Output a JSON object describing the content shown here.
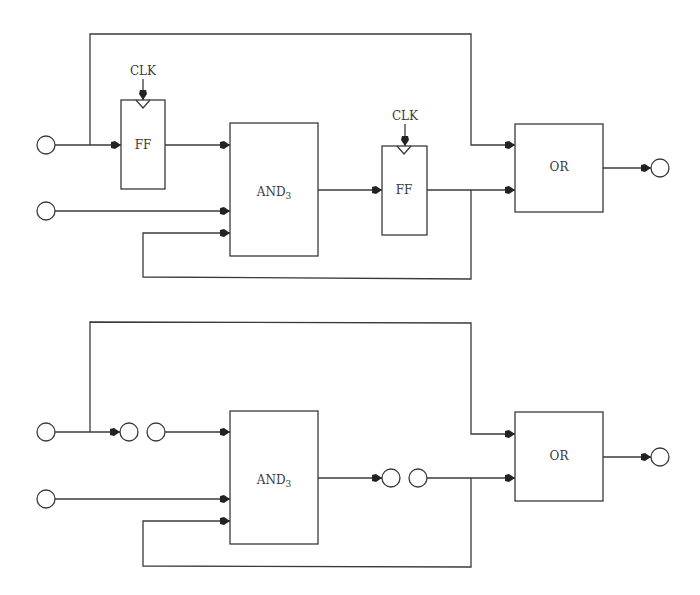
{
  "diagram": {
    "top": {
      "clk_label_1": "CLK",
      "clk_label_2": "CLK",
      "ff1_label": "FF",
      "ff2_label": "FF",
      "and_label": "AND",
      "and_subscript": "3",
      "or_label": "OR"
    },
    "bottom": {
      "and_label": "AND",
      "and_subscript": "3",
      "or_label": "OR"
    }
  },
  "colors": {
    "line": "#3a3a3a",
    "background": "#ffffff"
  }
}
